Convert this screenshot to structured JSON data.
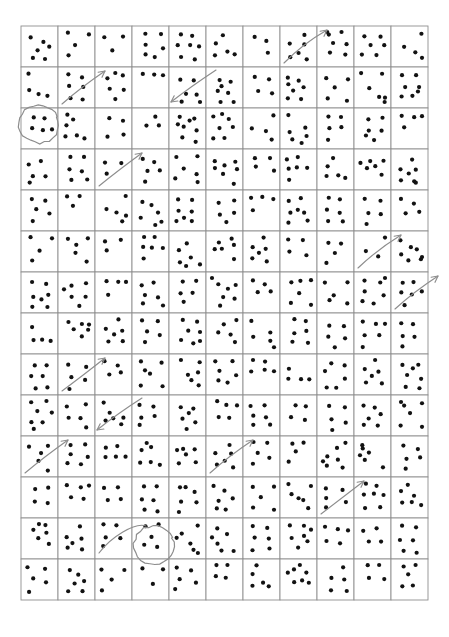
{
  "document": {
    "kind": "dot-counting-worksheet",
    "title": "",
    "background_color": "#ffffff",
    "page_width": 449,
    "page_height": 637
  },
  "grid": {
    "columns": 11,
    "rows": 14,
    "origin_x": 21,
    "origin_y": 26,
    "width": 407,
    "height": 574,
    "cell_width": 37,
    "cell_height": 41,
    "line_color": "#8f8f8f",
    "cell_fill": "#ffffff"
  },
  "dots": {
    "color": "#121212",
    "radius": 2.1,
    "counts_by_row": [
      [
        6,
        4,
        3,
        6,
        7,
        5,
        3,
        6,
        7,
        6,
        4
      ],
      [
        4,
        6,
        6,
        3,
        6,
        7,
        4,
        7,
        5,
        6,
        7
      ],
      [
        5,
        6,
        4,
        3,
        8,
        7,
        4,
        6,
        5,
        6,
        4
      ],
      [
        5,
        6,
        3,
        5,
        6,
        7,
        4,
        6,
        5,
        6,
        7
      ],
      [
        5,
        3,
        5,
        6,
        7,
        5,
        4,
        7,
        6,
        5,
        4
      ],
      [
        4,
        5,
        3,
        6,
        6,
        6,
        6,
        4,
        4,
        3,
        7
      ],
      [
        7,
        6,
        4,
        6,
        5,
        7,
        4,
        6,
        5,
        7,
        6
      ],
      [
        4,
        6,
        6,
        5,
        7,
        5,
        5,
        6,
        5,
        6,
        5
      ],
      [
        6,
        5,
        4,
        6,
        6,
        6,
        5,
        4,
        6,
        6,
        7
      ],
      [
        7,
        5,
        6,
        5,
        6,
        5,
        6,
        4,
        5,
        6,
        6
      ],
      [
        5,
        6,
        5,
        6,
        6,
        6,
        5,
        4,
        7,
        6,
        5
      ],
      [
        4,
        5,
        4,
        6,
        6,
        6,
        5,
        6,
        5,
        7,
        6
      ],
      [
        6,
        6,
        5,
        5,
        6,
        6,
        6,
        7,
        5,
        4,
        6
      ],
      [
        5,
        6,
        4,
        3,
        5,
        4,
        5,
        7,
        5,
        4,
        5
      ]
    ],
    "patterns": [
      [
        [
          9,
          9
        ],
        [
          20,
          14
        ],
        [
          14,
          22
        ],
        [
          26,
          20
        ],
        [
          10,
          31
        ],
        [
          22,
          31
        ]
      ],
      [
        [
          9,
          9
        ],
        [
          30,
          9
        ],
        [
          17,
          20
        ],
        [
          9,
          31
        ],
        [
          30,
          33
        ]
      ],
      [
        [
          9,
          9
        ],
        [
          30,
          9
        ],
        [
          18,
          24
        ],
        [
          29,
          32
        ]
      ],
      [
        [
          10,
          9
        ],
        [
          26,
          10
        ],
        [
          12,
          19
        ],
        [
          29,
          22
        ],
        [
          10,
          29
        ],
        [
          21,
          30
        ]
      ],
      [
        [
          10,
          8
        ],
        [
          21,
          8
        ],
        [
          9,
          18
        ],
        [
          20,
          19
        ],
        [
          30,
          18
        ],
        [
          11,
          31
        ],
        [
          24,
          32
        ]
      ],
      [
        [
          10,
          16
        ],
        [
          21,
          26
        ],
        [
          10,
          28
        ],
        [
          28,
          29
        ],
        [
          17,
          9
        ]
      ],
      [
        [
          13,
          12
        ],
        [
          26,
          14
        ],
        [
          27,
          27
        ]
      ],
      [
        [
          11,
          18
        ],
        [
          23,
          8
        ],
        [
          25,
          19
        ],
        [
          11,
          30
        ],
        [
          27,
          32
        ],
        [
          18,
          25
        ]
      ],
      [
        [
          10,
          8
        ],
        [
          24,
          9
        ],
        [
          13,
          20
        ],
        [
          27,
          22
        ],
        [
          11,
          30
        ],
        [
          25,
          32
        ],
        [
          18,
          11
        ]
      ],
      [
        [
          11,
          9
        ],
        [
          25,
          9
        ],
        [
          17,
          19
        ],
        [
          9,
          29
        ],
        [
          22,
          30
        ],
        [
          29,
          19
        ]
      ],
      [
        [
          30,
          7
        ],
        [
          11,
          20
        ],
        [
          22,
          23
        ],
        [
          28,
          31
        ]
      ],
      [
        [
          9,
          9
        ],
        [
          10,
          25
        ],
        [
          28,
          30
        ]
      ],
      [
        [
          11,
          9
        ],
        [
          24,
          11
        ],
        [
          12,
          22
        ],
        [
          26,
          21
        ],
        [
          11,
          32
        ],
        [
          25,
          33
        ],
        [
          18,
          27
        ]
      ],
      [
        [
          12,
          11
        ],
        [
          26,
          10
        ],
        [
          13,
          23
        ],
        [
          27,
          24
        ],
        [
          19,
          33
        ]
      ],
      [
        [
          9,
          8
        ],
        [
          21,
          9
        ],
        [
          31,
          10
        ],
        [
          12,
          21
        ],
        [
          24,
          22
        ],
        [
          10,
          32
        ]
      ],
      [
        [
          9,
          12
        ],
        [
          22,
          11
        ],
        [
          13,
          24
        ],
        [
          25,
          25
        ],
        [
          11,
          33
        ],
        [
          28,
          31
        ],
        [
          19,
          20
        ]
      ],
      [
        [
          12,
          10
        ],
        [
          25,
          11
        ],
        [
          10,
          22
        ],
        [
          22,
          23
        ],
        [
          13,
          33
        ],
        [
          27,
          34
        ],
        [
          19,
          20
        ]
      ],
      [
        [
          10,
          10
        ],
        [
          27,
          12
        ],
        [
          14,
          23
        ],
        [
          28,
          25
        ],
        [
          12,
          34
        ]
      ]
    ]
  },
  "annotations": {
    "pencil_color": "#8d8d8d",
    "circles": [
      {
        "name": "circled-cell-upper-left",
        "row": 3,
        "col": 1,
        "cx": 39,
        "cy": 124
      },
      {
        "name": "circled-cell-lower-middle",
        "row": 13,
        "col": 4,
        "cx": 154,
        "cy": 545
      }
    ],
    "arrows": [
      {
        "name": "arrow-r2c2",
        "row": 2,
        "col": 2,
        "direction": "up-right"
      },
      {
        "name": "arrow-r2c5",
        "row": 2,
        "col": 5,
        "direction": "down-left"
      },
      {
        "name": "arrow-r1c8",
        "row": 1,
        "col": 8,
        "direction": "up-right"
      },
      {
        "name": "arrow-r4c3",
        "row": 4,
        "col": 3,
        "direction": "up-right"
      },
      {
        "name": "arrow-r6c10",
        "row": 6,
        "col": 10,
        "direction": "up-right"
      },
      {
        "name": "arrow-r7c11",
        "row": 7,
        "col": 11,
        "direction": "up-right"
      },
      {
        "name": "arrow-r9c2",
        "row": 9,
        "col": 2,
        "direction": "up-right"
      },
      {
        "name": "arrow-r10c3",
        "row": 10,
        "col": 3,
        "direction": "down-left"
      },
      {
        "name": "arrow-r11c1",
        "row": 11,
        "col": 1,
        "direction": "up-right"
      },
      {
        "name": "arrow-r11c6",
        "row": 11,
        "col": 6,
        "direction": "up-right"
      },
      {
        "name": "arrow-r12c9",
        "row": 12,
        "col": 9,
        "direction": "up-right"
      },
      {
        "name": "curve-r13c3",
        "row": 13,
        "col": 3,
        "direction": "curve-to-circle"
      }
    ]
  }
}
